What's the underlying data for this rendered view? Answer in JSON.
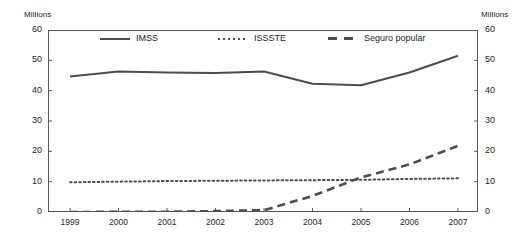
{
  "axis": {
    "left_unit": "Millions",
    "right_unit": "Millions",
    "y_ticks": [
      "60",
      "50",
      "40",
      "30",
      "20",
      "10",
      "0"
    ],
    "x_ticks": [
      "1999",
      "2000",
      "2001",
      "2002",
      "2003",
      "2004",
      "2005",
      "2006",
      "2007"
    ]
  },
  "legend": {
    "items": [
      {
        "label": "IMSS",
        "style": "solid",
        "color": "#4d4d4f"
      },
      {
        "label": "ISSSTE",
        "style": "dotted",
        "color": "#4d4d4f"
      },
      {
        "label": "Seguro popular",
        "style": "dashed",
        "color": "#4d4d4f"
      }
    ]
  },
  "chart_data": {
    "type": "line",
    "title": "",
    "xlabel": "",
    "ylabel": "Millions",
    "y2label": "Millions",
    "ylim": [
      0,
      60
    ],
    "ytick_step": 10,
    "grid": false,
    "legend_position": "top-inside",
    "categories": [
      "1999",
      "2000",
      "2001",
      "2002",
      "2003",
      "2004",
      "2005",
      "2006",
      "2007"
    ],
    "series": [
      {
        "name": "IMSS",
        "style": "solid",
        "color": "#4d4d4f",
        "values": [
          44.7,
          46.3,
          46.0,
          45.8,
          46.3,
          42.3,
          41.8,
          46.0,
          51.5
        ]
      },
      {
        "name": "ISSSTE",
        "style": "dotted",
        "color": "#4d4d4f",
        "values": [
          9.8,
          10.0,
          10.2,
          10.3,
          10.4,
          10.5,
          10.6,
          10.9,
          11.1
        ]
      },
      {
        "name": "Seguro popular",
        "style": "dashed",
        "color": "#4d4d4f",
        "values": [
          0.0,
          0.05,
          0.1,
          0.3,
          0.6,
          5.3,
          11.4,
          15.7,
          21.8
        ]
      }
    ]
  }
}
